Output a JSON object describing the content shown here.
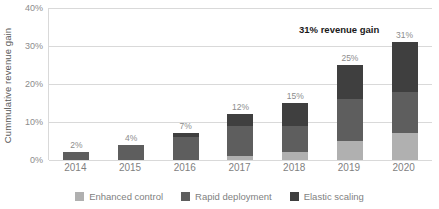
{
  "chart_data": {
    "type": "bar",
    "subtype": "stacked-column",
    "title": "",
    "xlabel": "",
    "ylabel": "Cummulative revenue gain",
    "ylim": [
      0,
      40
    ],
    "ytick_labels": [
      "0%",
      "10%",
      "20%",
      "30%",
      "40%"
    ],
    "ytick_values": [
      0,
      10,
      20,
      30,
      40
    ],
    "grid": true,
    "legend_position": "bottom",
    "categories": [
      "2014",
      "2015",
      "2016",
      "2017",
      "2018",
      "2019",
      "2020"
    ],
    "series": [
      {
        "name": "Enhanced control",
        "color": "#b0b0b0",
        "values": [
          0,
          0,
          0,
          1,
          2,
          5,
          7
        ]
      },
      {
        "name": "Rapid deployment",
        "color": "#5e5e5e",
        "values": [
          2,
          4,
          6,
          8,
          7,
          11,
          11
        ]
      },
      {
        "name": "Elastic scaling",
        "color": "#3f3f3f",
        "values": [
          0,
          0,
          1,
          3,
          6,
          9,
          13
        ]
      }
    ],
    "totals": [
      2,
      4,
      7,
      12,
      15,
      25,
      31
    ],
    "data_labels": [
      "2%",
      "4%",
      "7%",
      "12%",
      "15%",
      "25%",
      "31%"
    ],
    "annotations": [
      {
        "text": "31% revenue gain",
        "color": "#1a1a1a",
        "bold": true
      }
    ]
  },
  "legend": {
    "items": [
      {
        "label": "Enhanced control",
        "color": "#b0b0b0"
      },
      {
        "label": "Rapid deployment",
        "color": "#5e5e5e"
      },
      {
        "label": "Elastic scaling",
        "color": "#3f3f3f"
      }
    ]
  },
  "colors": {
    "gridline": "#d9d9d9",
    "axis_text": "#8c8c8c",
    "category_text": "#7f7f7f",
    "background": "#ffffff"
  }
}
